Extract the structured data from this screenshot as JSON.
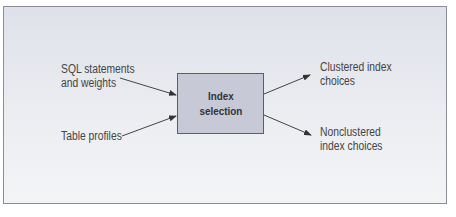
{
  "diagram": {
    "process": {
      "line1": "Index",
      "line2": "selection"
    },
    "inputs": [
      {
        "line1": "SQL statements",
        "line2": "and weights"
      },
      {
        "line1": "Table profiles"
      }
    ],
    "outputs": [
      {
        "line1": "Clustered index",
        "line2": "choices"
      },
      {
        "line1": "Nonclustered",
        "line2": "index choices"
      }
    ],
    "colors": {
      "background": "#e6e8ee",
      "box": "#c7c9d6",
      "border": "#5c5f6a",
      "text": "#444444"
    }
  }
}
